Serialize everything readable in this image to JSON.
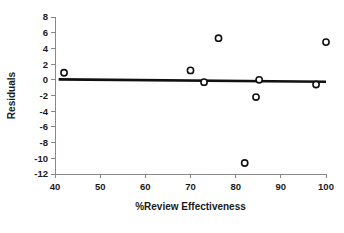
{
  "chart_data": {
    "type": "scatter",
    "title": "",
    "xlabel": "%Review Effectiveness",
    "ylabel": "Residuals",
    "xlim": [
      40,
      100
    ],
    "ylim": [
      -12,
      8
    ],
    "xticks": [
      40,
      50,
      60,
      70,
      80,
      90,
      100
    ],
    "yticks": [
      8,
      6,
      4,
      2,
      0,
      -2,
      -4,
      -6,
      -8,
      -10,
      -12
    ],
    "xtick_labels": [
      "40",
      "50",
      "60",
      "70",
      "80",
      "90",
      "100"
    ],
    "ytick_labels": [
      "8",
      "6",
      "4",
      "2",
      "0",
      "-2",
      "-4",
      "-6",
      "-8",
      "-10",
      "-12"
    ],
    "grid": false,
    "legend": null,
    "marker_style": "open-circle",
    "points": [
      {
        "x": 42.0,
        "y": 0.9
      },
      {
        "x": 70.0,
        "y": 1.2
      },
      {
        "x": 73.0,
        "y": -0.3
      },
      {
        "x": 76.2,
        "y": 5.3
      },
      {
        "x": 82.0,
        "y": -10.6
      },
      {
        "x": 84.5,
        "y": -2.2
      },
      {
        "x": 85.2,
        "y": 0.0
      },
      {
        "x": 97.8,
        "y": -0.6
      },
      {
        "x": 100.0,
        "y": 4.8
      }
    ],
    "reference_line": {
      "type": "linear-fit",
      "x_start": 40.8,
      "y_start": 0.05,
      "x_end": 100.0,
      "y_end": -0.25
    }
  }
}
